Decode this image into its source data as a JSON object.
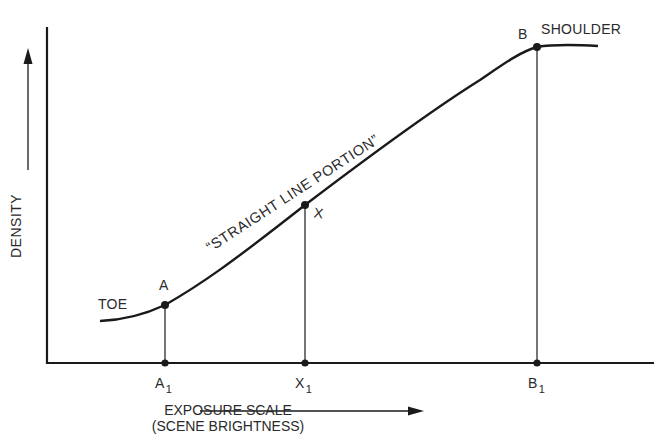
{
  "diagram": {
    "type": "characteristic-curve",
    "y_axis_label": "DENSITY",
    "x_axis_label_line1": "EXPOSURE SCALE",
    "x_axis_label_line2": "(SCENE BRIGHTNESS)",
    "region_labels": {
      "toe": "TOE",
      "shoulder": "SHOULDER",
      "straight": "“STRAIGHT LINE PORTION”"
    },
    "points": [
      {
        "name": "A",
        "label": "A"
      },
      {
        "name": "X",
        "label": "X"
      },
      {
        "name": "B",
        "label": "B"
      }
    ],
    "x_ticks": [
      {
        "base": "A",
        "sub": "1"
      },
      {
        "base": "X",
        "sub": "1"
      },
      {
        "base": "B",
        "sub": "1"
      }
    ],
    "line_color": "#1a1a1a"
  }
}
